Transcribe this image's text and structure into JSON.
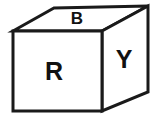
{
  "figure": {
    "type": "isometric-cube",
    "canvas": {
      "width": 157,
      "height": 120
    },
    "background_color": "#ffffff",
    "stroke_color": "#1a1a1a",
    "fill_color": "#ffffff",
    "label_color": "#111111",
    "stroke_width": 3
  },
  "faces": [
    {
      "id": "top",
      "name": "top-face",
      "label": "B",
      "points": "13,31 54,8 148,6 102,31",
      "label_x": 77,
      "label_y": 20,
      "label_class": "label-b"
    },
    {
      "id": "front",
      "name": "front-face",
      "label": "R",
      "points": "13,31 102,31 102,111 13,111",
      "label_x": 54,
      "label_y": 73,
      "label_class": "label-r"
    },
    {
      "id": "right",
      "name": "right-face",
      "label": "Y",
      "points": "102,31 148,6 148,92 102,111",
      "label_x": 124,
      "label_y": 61,
      "label_class": "label-y"
    }
  ]
}
